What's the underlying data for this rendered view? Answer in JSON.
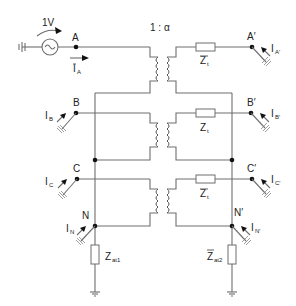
{
  "diagram": {
    "type": "circuit-schematic",
    "source": {
      "label": "1V",
      "symbol": "ac-voltage-source"
    },
    "transformer_ratio": "1 : α",
    "nodes": {
      "A": "A",
      "B": "B",
      "C": "C",
      "N": "N",
      "A_prime": "A′",
      "B_prime": "B′",
      "C_prime": "C′",
      "N_prime": "N′"
    },
    "currents": {
      "iA": {
        "main": "I",
        "sub": "A"
      },
      "iB": {
        "main": "I",
        "sub": "B"
      },
      "iC": {
        "main": "I",
        "sub": "C"
      },
      "iN": {
        "main": "I",
        "sub": "N"
      },
      "iA_prime": {
        "main": "I",
        "sub": "A′"
      },
      "iB_prime": {
        "main": "I",
        "sub": "B′"
      },
      "iC_prime": {
        "main": "I",
        "sub": "C′"
      },
      "iN_prime": {
        "main": "I",
        "sub": "N′"
      }
    },
    "impedances": {
      "zt_1": {
        "main": "Z",
        "sub": "t"
      },
      "zt_2": {
        "main": "Z",
        "sub": "t"
      },
      "zt_3": {
        "main": "Z",
        "sub": "t"
      },
      "zat1": {
        "main": "Z",
        "sub": "at1"
      },
      "zat2": {
        "main": "Z",
        "sub": "at2"
      }
    },
    "colors": {
      "wire": "#6e6e6e",
      "node": "#111111",
      "background": "#ffffff"
    }
  }
}
